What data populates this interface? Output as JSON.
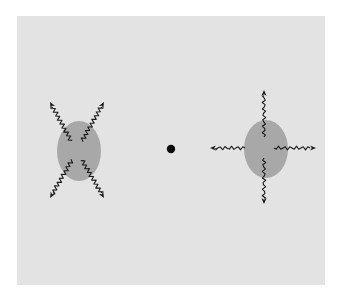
{
  "figure": {
    "width": 339,
    "height": 299,
    "background": "#ffffff",
    "panel": {
      "x": 17,
      "y": 16,
      "width": 308,
      "height": 269,
      "fill": "#e3e3e3"
    },
    "colors": {
      "blob": "#a8a8a8",
      "arrow": "#1a1a1a",
      "dot": "#0a0a0a"
    },
    "center_dot": {
      "cx": 171,
      "cy": 149,
      "r": 4.2
    },
    "left_source": {
      "label": "diagonal-emission",
      "ellipse": {
        "cx": 79,
        "cy": 151,
        "rx": 22,
        "ry": 30
      },
      "arrows": [
        {
          "name": "upper-left",
          "x1": 71,
          "y1": 141,
          "x2": 50,
          "y2": 102
        },
        {
          "name": "upper-right",
          "x1": 82,
          "y1": 141,
          "x2": 104,
          "y2": 102
        },
        {
          "name": "lower-left",
          "x1": 72,
          "y1": 160,
          "x2": 50,
          "y2": 198
        },
        {
          "name": "lower-right",
          "x1": 82,
          "y1": 160,
          "x2": 104,
          "y2": 198
        }
      ]
    },
    "right_source": {
      "label": "axial-emission",
      "ellipse": {
        "cx": 266,
        "cy": 149,
        "rx": 22,
        "ry": 29
      },
      "arrows": [
        {
          "name": "up",
          "x1": 264,
          "y1": 137,
          "x2": 264,
          "y2": 90
        },
        {
          "name": "down",
          "x1": 264,
          "y1": 158,
          "x2": 264,
          "y2": 204
        },
        {
          "name": "left",
          "x1": 245,
          "y1": 148,
          "x2": 210,
          "y2": 148
        },
        {
          "name": "right",
          "x1": 274,
          "y1": 148,
          "x2": 316,
          "y2": 148
        }
      ]
    }
  }
}
